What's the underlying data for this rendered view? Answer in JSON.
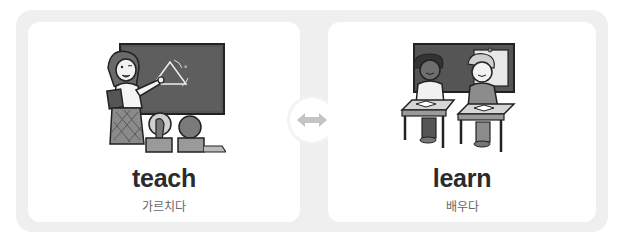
{
  "cards": [
    {
      "word": "teach",
      "meaning": "가르치다",
      "illustration": "teacher-at-chalkboard-illustration"
    },
    {
      "word": "learn",
      "meaning": "배우다",
      "illustration": "students-at-desks-illustration"
    }
  ],
  "connector": {
    "icon": "double-arrow-icon",
    "color": "#c4c4c4"
  },
  "colors": {
    "frame": "#efefef",
    "card": "#ffffff",
    "word": "#2b2b2b",
    "meaning": "#666666"
  }
}
